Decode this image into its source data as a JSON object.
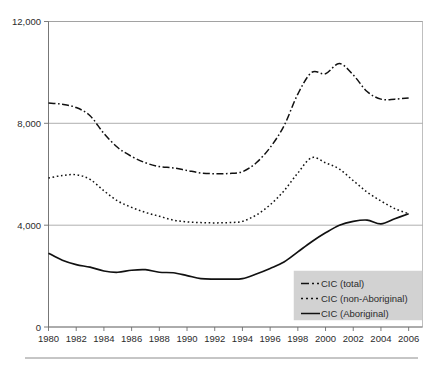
{
  "chart_data": {
    "type": "line",
    "title": "",
    "subtitle": "",
    "xlabel": "",
    "ylabel": "",
    "xlim": [
      1980,
      2007
    ],
    "ylim": [
      0,
      12000
    ],
    "grid": true,
    "legend_position": "bottom-right",
    "x": [
      1980,
      1981,
      1982,
      1983,
      1984,
      1985,
      1986,
      1987,
      1988,
      1989,
      1990,
      1991,
      1992,
      1993,
      1994,
      1995,
      1996,
      1997,
      1998,
      1999,
      2000,
      2001,
      2002,
      2003,
      2004,
      2005,
      2006
    ],
    "y_ticks": [
      0,
      4000,
      8000,
      12000
    ],
    "y_tick_labels": [
      "0",
      "4,000",
      "8,000",
      "12,000"
    ],
    "x_ticks": [
      1980,
      1982,
      1984,
      1986,
      1988,
      1990,
      1992,
      1994,
      1996,
      1998,
      2000,
      2002,
      2004,
      2006
    ],
    "x_tick_labels": [
      "1980",
      "1982",
      "1984",
      "1986",
      "1988",
      "1990",
      "1992",
      "1994",
      "1996",
      "1998",
      "2000",
      "2002",
      "2004",
      "2006"
    ],
    "series": [
      {
        "name": "CIC (total)",
        "style": "dash-dot",
        "color": "#111111",
        "values": [
          8800,
          8750,
          8620,
          8300,
          7600,
          7050,
          6700,
          6450,
          6300,
          6250,
          6150,
          6050,
          6020,
          6030,
          6100,
          6450,
          7050,
          7900,
          9150,
          10000,
          9950,
          10350,
          9900,
          9250,
          8950,
          8950,
          9000
        ]
      },
      {
        "name": "CIC (non-Aboriginal)",
        "style": "dotted",
        "color": "#111111",
        "values": [
          5850,
          5950,
          5980,
          5800,
          5350,
          4950,
          4700,
          4500,
          4350,
          4200,
          4130,
          4100,
          4090,
          4100,
          4150,
          4400,
          4800,
          5350,
          6050,
          6650,
          6450,
          6200,
          5750,
          5300,
          4950,
          4650,
          4450
        ]
      },
      {
        "name": "CIC (Aboriginal)",
        "style": "solid",
        "color": "#111111",
        "values": [
          2900,
          2620,
          2450,
          2350,
          2200,
          2150,
          2230,
          2250,
          2150,
          2130,
          2020,
          1900,
          1880,
          1880,
          1900,
          2080,
          2300,
          2550,
          2950,
          3350,
          3700,
          4000,
          4150,
          4200,
          4050,
          4250,
          4450
        ]
      }
    ]
  },
  "legend": {
    "entries": [
      {
        "label": "CIC (total)",
        "style": "dash-dot"
      },
      {
        "label": "CIC (non-Aboriginal)",
        "style": "dotted"
      },
      {
        "label": "CIC (Aboriginal)",
        "style": "solid"
      }
    ]
  }
}
